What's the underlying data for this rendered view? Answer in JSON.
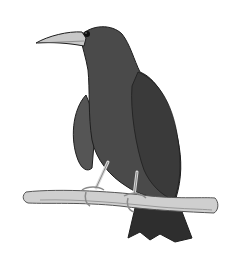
{
  "image": {
    "subject": "crow perched on a branch",
    "width": 239,
    "height": 258,
    "colors": {
      "background": "#ffffff",
      "body": "#4a4a4a",
      "body_dark": "#2e2e2e",
      "wing": "#555555",
      "beak": "#c8c8c8",
      "branch": "#cfcfcf",
      "branch_shade": "#9a9a9a",
      "legs": "#d8d8d8",
      "outline": "#1e1e1e"
    }
  }
}
